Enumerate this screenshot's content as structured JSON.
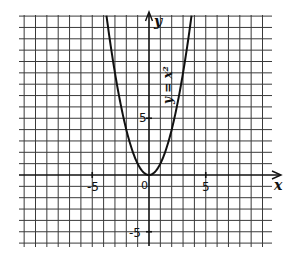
{
  "figure": {
    "equation_label": "y = x²",
    "x_axis_label": "x",
    "y_axis_label": "y",
    "origin_label": "0",
    "x_ticks": [
      {
        "value": -5,
        "label": "-5"
      },
      {
        "value": 5,
        "label": "5"
      }
    ],
    "y_ticks": [
      {
        "value": 5,
        "label": "5"
      },
      {
        "value": -5,
        "label": "-5"
      }
    ],
    "colors": {
      "grid": "#3a3a3a",
      "axis": "#111111",
      "curve": "#111111",
      "background": "#ffffff"
    }
  },
  "chart_data": {
    "type": "line",
    "title": "",
    "xlabel": "x",
    "ylabel": "y",
    "xlim": [
      -11,
      10
    ],
    "ylim": [
      -6,
      14
    ],
    "grid": true,
    "series": [
      {
        "name": "y = x²",
        "x": [
          -3.74,
          -3,
          -2,
          -1,
          0,
          1,
          2,
          3,
          3.74
        ],
        "y": [
          14,
          9,
          4,
          1,
          0,
          1,
          4,
          9,
          14
        ]
      }
    ],
    "annotations": [
      "y = x²"
    ],
    "tick_labels": {
      "x": [
        "-5",
        "0",
        "5"
      ],
      "y": [
        "5",
        "-5"
      ]
    }
  }
}
